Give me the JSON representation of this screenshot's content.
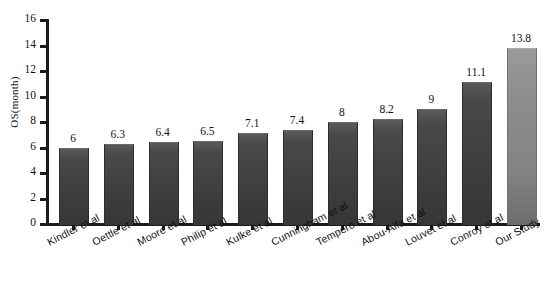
{
  "chart_data": {
    "type": "bar",
    "title": "",
    "subtitle": "",
    "xlabel": "",
    "ylabel": "OS(month)",
    "ylim": [
      0,
      16
    ],
    "ytick_step": 2,
    "ytick_labels": [
      "0",
      "2",
      "4",
      "6",
      "8",
      "10",
      "12",
      "14",
      "16"
    ],
    "grid": false,
    "legend": null,
    "categories": [
      "Kindler et al",
      "Oettle et al",
      "Moore et al",
      "Philip et al",
      "Kulke et al",
      "Cunningham et al",
      "Tempero et al",
      "Abou-Alfa et al",
      "Louvet et al",
      "Conroy et al",
      "Our Study"
    ],
    "values": [
      6,
      6.3,
      6.4,
      6.5,
      7.1,
      7.4,
      8,
      8.2,
      9,
      11.1,
      13.8
    ],
    "value_labels": [
      "6",
      "6.3",
      "6.4",
      "6.5",
      "7.1",
      "7.4",
      "8",
      "8.2",
      "9",
      "11.1",
      "13.8"
    ],
    "bar_colors": [
      "#3f3f3f",
      "#3f3f3f",
      "#3f3f3f",
      "#3f3f3f",
      "#3f3f3f",
      "#3f3f3f",
      "#3f3f3f",
      "#3f3f3f",
      "#3f3f3f",
      "#3f3f3f",
      "#838383"
    ],
    "highlight_index": 10,
    "axis_color": "#1b1b1b",
    "background": "#ffffff"
  }
}
